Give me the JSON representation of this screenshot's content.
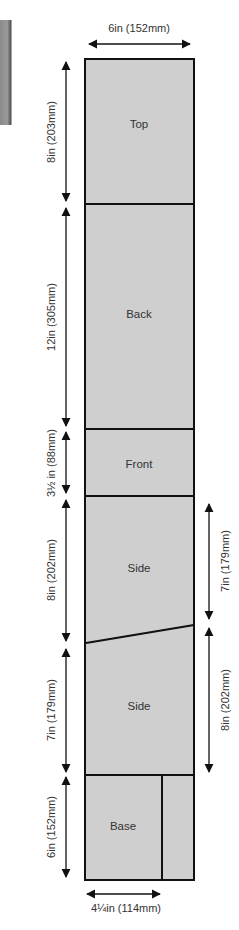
{
  "diagram": {
    "colors": {
      "board_fill": "#cfcfcf",
      "outline": "#111111",
      "text": "#333333"
    },
    "parts": [
      {
        "name": "Top",
        "label": "Top"
      },
      {
        "name": "Back",
        "label": "Back"
      },
      {
        "name": "Front",
        "label": "Front"
      },
      {
        "name": "Side-1",
        "label": "Side"
      },
      {
        "name": "Side-2",
        "label": "Side"
      },
      {
        "name": "Base",
        "label": "Base"
      }
    ],
    "dimensions": {
      "width_top": "6in (152mm)",
      "top_height": "8in (203mm)",
      "back_height": "12in (305mm)",
      "front_height": "3½ in (88mm)",
      "side1_left_height": "8in (202mm)",
      "side2_left_height": "7in (179mm)",
      "base_height": "6in (152mm)",
      "side1_right_height": "7in (179mm)",
      "side2_right_height": "8in (202mm)",
      "base_width": "4¼in (114mm)"
    }
  }
}
